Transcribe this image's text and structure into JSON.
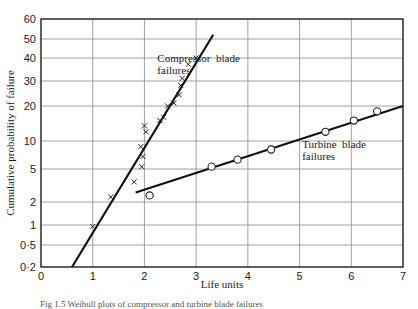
{
  "chart_data": {
    "type": "scatter",
    "title": "",
    "xlabel": "Life units",
    "ylabel": "Cumulative probability of failure",
    "xlim": [
      0,
      7
    ],
    "ylim": [
      0.2,
      60
    ],
    "yscale": "probability (log-like)",
    "grid": true,
    "x_ticks": [
      0,
      1,
      2,
      3,
      4,
      5,
      6,
      7
    ],
    "y_ticks": [
      "0·2",
      "0·5",
      "1",
      "2",
      "5",
      "10",
      "20",
      "30",
      "40",
      "50",
      "60"
    ],
    "series": [
      {
        "name": "Compressor blade failures",
        "marker": "x",
        "points": [
          [
            1.0,
            0.95
          ],
          [
            1.35,
            2.3
          ],
          [
            1.8,
            3.5
          ],
          [
            1.95,
            5.3
          ],
          [
            1.97,
            6.8
          ],
          [
            1.93,
            8.7
          ],
          [
            2.0,
            13.5
          ],
          [
            2.03,
            12
          ],
          [
            2.3,
            15
          ],
          [
            2.37,
            16
          ],
          [
            2.45,
            20
          ],
          [
            2.57,
            21
          ],
          [
            2.67,
            24
          ],
          [
            2.7,
            28
          ],
          [
            2.73,
            31
          ],
          [
            2.85,
            37
          ],
          [
            3.0,
            40
          ]
        ],
        "fit_line": [
          [
            0.6,
            0.2
          ],
          [
            3.33,
            52
          ]
        ]
      },
      {
        "name": "Turbine blade failures",
        "marker": "o",
        "points": [
          [
            2.1,
            2.4
          ],
          [
            3.3,
            5.3
          ],
          [
            3.8,
            6.3
          ],
          [
            4.45,
            8.1
          ],
          [
            5.5,
            12
          ],
          [
            6.05,
            15
          ],
          [
            6.5,
            18
          ]
        ],
        "fit_line": [
          [
            1.83,
            2.6
          ],
          [
            7.0,
            20
          ]
        ]
      }
    ],
    "annotations": [
      {
        "text": [
          "Compressor  blade",
          "failures"
        ],
        "x": 2.25,
        "y": 38
      },
      {
        "text": [
          "Turbine  blade",
          "failures"
        ],
        "x": 5.05,
        "y": 8.4
      }
    ]
  },
  "caption": "Fig 1.5  Weibull plots of compressor and turbine blade failures"
}
